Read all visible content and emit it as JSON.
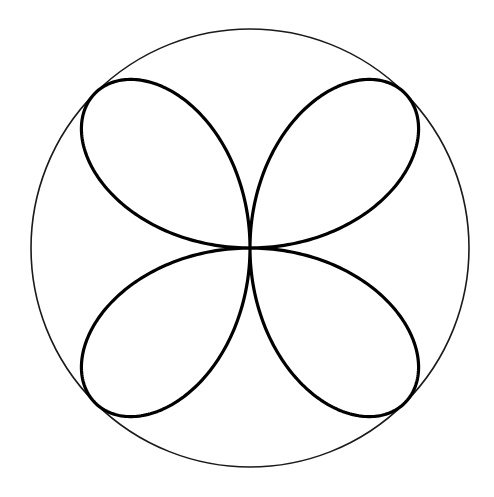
{
  "figure": {
    "width": 494,
    "height": 497,
    "background": "#ffffff",
    "center": {
      "x": 250,
      "y": 248
    },
    "circle": {
      "radius": 219,
      "stroke": "#1a1a1a",
      "stroke_width": 1.6
    },
    "rose": {
      "equation": "r = R * |sin(2θ)|",
      "petals": 4,
      "radius": 219,
      "stroke": "#000000",
      "stroke_width": 3.2,
      "samples": 720
    }
  }
}
